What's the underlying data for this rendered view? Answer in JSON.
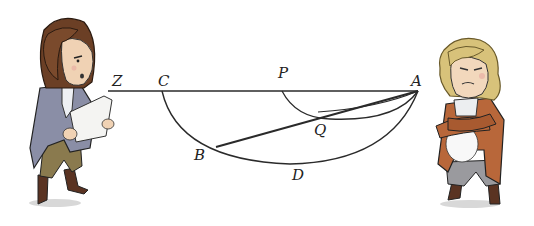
{
  "diagram": {
    "labels": {
      "Z": "Z",
      "C": "C",
      "P": "P",
      "A": "A",
      "Q": "Q",
      "B": "B",
      "D": "D"
    },
    "line_color": "#2a2a2a"
  },
  "characters": {
    "left": {
      "name": "left-figure",
      "coat_color": "#8a8ea6",
      "hair_color": "#6b3f25",
      "breeches_color": "#8a7a4e"
    },
    "right": {
      "name": "right-figure",
      "coat_color": "#b8673a",
      "hair_color": "#d8c27a",
      "breeches_color": "#9a9a9e"
    }
  }
}
